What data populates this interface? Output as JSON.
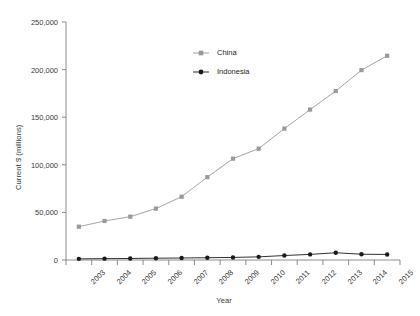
{
  "chart_data": {
    "type": "line",
    "title": "",
    "xlabel": "Year",
    "ylabel": "Current $ (millions)",
    "categories": [
      "2003",
      "2004",
      "2005",
      "2006",
      "2007",
      "2008",
      "2009",
      "2010",
      "2011",
      "2012",
      "2013",
      "2014",
      "2015"
    ],
    "series": [
      {
        "name": "China",
        "color": "#9a9a9a",
        "marker": "square",
        "values": [
          35000,
          41000,
          45500,
          54000,
          66500,
          87000,
          106500,
          117000,
          138000,
          158000,
          177500,
          199500,
          214500
        ]
      },
      {
        "name": "Indonesia",
        "color": "#1a1a1a",
        "marker": "circle",
        "values": [
          1200,
          1400,
          1600,
          1900,
          2100,
          2400,
          2700,
          3300,
          4700,
          5900,
          7600,
          6100,
          5800
        ]
      }
    ],
    "ylim": [
      0,
      250000
    ],
    "y_ticks": [
      0,
      50000,
      100000,
      150000,
      200000,
      250000
    ],
    "y_tick_labels": [
      "0",
      "50,000",
      "100,000",
      "150,000",
      "200,000",
      "250,000"
    ],
    "grid": false,
    "legend_position": "upper-center-left",
    "legend_entries": [
      "China",
      "Indonesia"
    ],
    "axis_color": "#808080",
    "background": "#ffffff"
  }
}
